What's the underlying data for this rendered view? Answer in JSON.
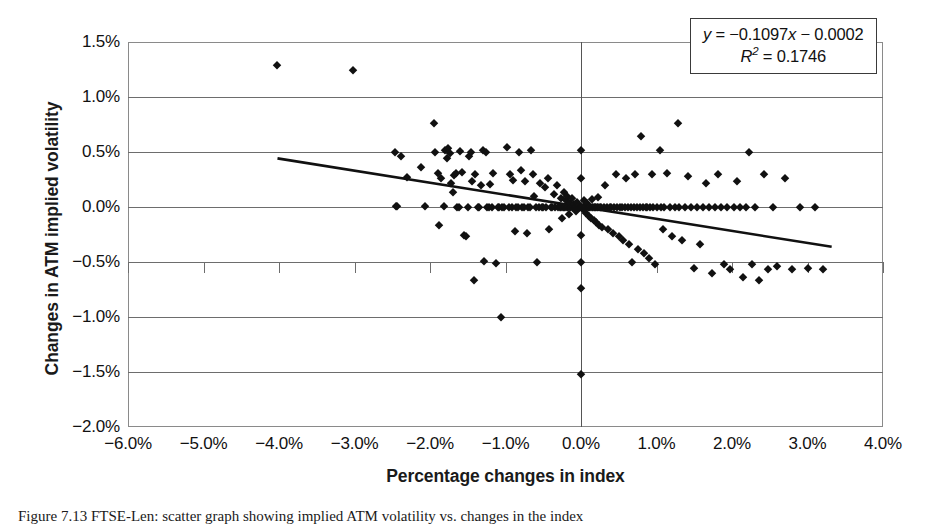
{
  "figure": {
    "caption": "Figure 7.13  FTSE-Len: scatter graph showing implied ATM volatility vs. changes in the index"
  },
  "annotation": {
    "equation": "y = −0.1097x − 0.0002",
    "equation_prefix": "y",
    "equation_body": " = −0.1097",
    "equation_var": "x",
    "equation_suffix": " − 0.0002",
    "r_squared_symbol": "R",
    "r_squared_exponent": "2",
    "r_squared_value": " = 0.1746",
    "slope": -0.1097,
    "intercept": -0.0002,
    "r_squared": 0.1746
  },
  "chart_data": {
    "type": "scatter",
    "title": "",
    "xlabel": "Percentage changes in index",
    "ylabel": "Changes in ATM implied volatility",
    "xlim": [
      -6.0,
      4.0
    ],
    "ylim": [
      -2.0,
      1.5
    ],
    "xticks": [
      -6.0,
      -5.0,
      -4.0,
      -3.0,
      -2.0,
      -1.0,
      0.0,
      1.0,
      2.0,
      3.0,
      4.0
    ],
    "yticks": [
      1.5,
      1.0,
      0.5,
      0.0,
      -0.5,
      -1.0,
      -1.5,
      -2.0
    ],
    "xtick_labels": [
      "-6.0%",
      "-5.0%",
      "-4.0%",
      "-3.0%",
      "-2.0%",
      "-1.0%",
      "0.0%",
      "1.0%",
      "2.0%",
      "3.0%",
      "4.0%"
    ],
    "ytick_labels": [
      "1.5%",
      "1.0%",
      "0.5%",
      "0.0%",
      "-0.5%",
      "-1.0%",
      "-1.5%",
      "-2.0%"
    ],
    "grid": "horizontal",
    "legend": "none",
    "marker": "diamond",
    "marker_color": "#111111",
    "trendline": {
      "type": "linear",
      "x_start": -4.02,
      "y_start": 0.442,
      "x_end": 3.32,
      "y_end": -0.362,
      "color": "#111111"
    },
    "points": [
      [
        -4.02,
        1.29
      ],
      [
        -3.02,
        1.25
      ],
      [
        -2.47,
        0.5
      ],
      [
        -2.38,
        0.46
      ],
      [
        -2.45,
        0.01
      ],
      [
        -2.44,
        0.005
      ],
      [
        -2.3,
        0.27
      ],
      [
        -2.12,
        0.36
      ],
      [
        -2.06,
        0.01
      ],
      [
        -1.95,
        0.76
      ],
      [
        -1.93,
        0.5
      ],
      [
        -1.9,
        0.31
      ],
      [
        -1.88,
        -0.16
      ],
      [
        -1.86,
        0.26
      ],
      [
        -1.82,
        0.01
      ],
      [
        -1.8,
        0.52
      ],
      [
        -1.78,
        0.45
      ],
      [
        -1.76,
        0.54
      ],
      [
        -1.74,
        0.49
      ],
      [
        -1.72,
        0.22
      ],
      [
        -1.7,
        0.14
      ],
      [
        -1.68,
        0.29
      ],
      [
        -1.66,
        0.31
      ],
      [
        -1.64,
        0.0
      ],
      [
        -1.62,
        0.0
      ],
      [
        -1.6,
        0.51
      ],
      [
        -1.57,
        0.32
      ],
      [
        -1.55,
        -0.25
      ],
      [
        -1.52,
        -0.26
      ],
      [
        -1.5,
        0.0
      ],
      [
        -1.48,
        0.46
      ],
      [
        -1.46,
        0.5
      ],
      [
        -1.44,
        0.24
      ],
      [
        -1.42,
        -0.66
      ],
      [
        -1.4,
        0.3
      ],
      [
        -1.37,
        0.0
      ],
      [
        -1.35,
        0.0
      ],
      [
        -1.32,
        0.2
      ],
      [
        -1.3,
        0.52
      ],
      [
        -1.28,
        -0.49
      ],
      [
        -1.26,
        0.5
      ],
      [
        -1.24,
        0.0
      ],
      [
        -1.22,
        0.0
      ],
      [
        -1.2,
        0.21
      ],
      [
        -1.18,
        0.0
      ],
      [
        -1.16,
        0.31
      ],
      [
        -1.13,
        -0.51
      ],
      [
        -1.1,
        0.0
      ],
      [
        -1.08,
        0.0
      ],
      [
        -1.06,
        -1.0
      ],
      [
        -1.04,
        0.0
      ],
      [
        -1.02,
        0.0
      ],
      [
        -0.98,
        0.55
      ],
      [
        -0.96,
        0.0
      ],
      [
        -0.94,
        0.3
      ],
      [
        -0.92,
        0.0
      ],
      [
        -0.9,
        0.25
      ],
      [
        -0.88,
        -0.22
      ],
      [
        -0.86,
        0.0
      ],
      [
        -0.84,
        0.0
      ],
      [
        -0.82,
        0.5
      ],
      [
        -0.8,
        0.34
      ],
      [
        -0.78,
        0.0
      ],
      [
        -0.76,
        0.0
      ],
      [
        -0.74,
        0.24
      ],
      [
        -0.72,
        -0.24
      ],
      [
        -0.7,
        0.0
      ],
      [
        -0.68,
        0.0
      ],
      [
        -0.66,
        0.52
      ],
      [
        -0.64,
        0.3
      ],
      [
        -0.62,
        0.1
      ],
      [
        -0.6,
        0.0
      ],
      [
        -0.58,
        -0.5
      ],
      [
        -0.56,
        0.0
      ],
      [
        -0.54,
        0.22
      ],
      [
        -0.52,
        0.0
      ],
      [
        -0.5,
        0.0
      ],
      [
        -0.48,
        0.18
      ],
      [
        -0.46,
        0.0
      ],
      [
        -0.44,
        0.26
      ],
      [
        -0.42,
        -0.2
      ],
      [
        -0.4,
        0.0
      ],
      [
        -0.38,
        0.0
      ],
      [
        -0.36,
        0.12
      ],
      [
        -0.34,
        0.0
      ],
      [
        -0.32,
        0.2
      ],
      [
        -0.3,
        0.0
      ],
      [
        -0.28,
        0.0
      ],
      [
        -0.27,
        0.08
      ],
      [
        -0.26,
        0.0
      ],
      [
        -0.25,
        -0.1
      ],
      [
        -0.24,
        0.0
      ],
      [
        -0.23,
        0.14
      ],
      [
        -0.22,
        0.0
      ],
      [
        -0.21,
        0.0
      ],
      [
        -0.2,
        0.06
      ],
      [
        -0.19,
        0.0
      ],
      [
        -0.18,
        0.1
      ],
      [
        -0.17,
        0.0
      ],
      [
        -0.16,
        -0.06
      ],
      [
        -0.15,
        0.0
      ],
      [
        -0.14,
        0.04
      ],
      [
        -0.13,
        0.0
      ],
      [
        -0.12,
        0.08
      ],
      [
        -0.11,
        0.0
      ],
      [
        -0.1,
        0.0
      ],
      [
        -0.09,
        0.03
      ],
      [
        -0.08,
        0.0
      ],
      [
        -0.07,
        -0.04
      ],
      [
        -0.06,
        0.0
      ],
      [
        -0.05,
        0.05
      ],
      [
        -0.04,
        0.0
      ],
      [
        -0.03,
        0.0
      ],
      [
        -0.02,
        0.02
      ],
      [
        -0.01,
        0.0
      ],
      [
        0.0,
        0.0
      ],
      [
        0.0,
        0.52
      ],
      [
        0.0,
        0.26
      ],
      [
        0.0,
        -0.25
      ],
      [
        0.0,
        -0.5
      ],
      [
        0.0,
        -0.74
      ],
      [
        0.0,
        -1.52
      ],
      [
        0.01,
        0.0
      ],
      [
        0.02,
        -0.02
      ],
      [
        0.03,
        0.0
      ],
      [
        0.04,
        0.06
      ],
      [
        0.05,
        0.0
      ],
      [
        0.06,
        -0.05
      ],
      [
        0.07,
        0.0
      ],
      [
        0.08,
        0.04
      ],
      [
        0.09,
        0.0
      ],
      [
        0.1,
        -0.08
      ],
      [
        0.11,
        0.0
      ],
      [
        0.12,
        0.0
      ],
      [
        0.13,
        -0.1
      ],
      [
        0.14,
        0.0
      ],
      [
        0.15,
        0.07
      ],
      [
        0.16,
        0.0
      ],
      [
        0.17,
        -0.12
      ],
      [
        0.18,
        0.0
      ],
      [
        0.19,
        0.0
      ],
      [
        0.2,
        -0.14
      ],
      [
        0.21,
        0.0
      ],
      [
        0.22,
        0.09
      ],
      [
        0.23,
        0.0
      ],
      [
        0.24,
        -0.16
      ],
      [
        0.25,
        0.0
      ],
      [
        0.26,
        0.0
      ],
      [
        0.28,
        -0.18
      ],
      [
        0.3,
        0.0
      ],
      [
        0.32,
        0.2
      ],
      [
        0.34,
        0.0
      ],
      [
        0.36,
        -0.2
      ],
      [
        0.38,
        0.0
      ],
      [
        0.4,
        0.0
      ],
      [
        0.42,
        -0.24
      ],
      [
        0.44,
        0.0
      ],
      [
        0.46,
        0.3
      ],
      [
        0.48,
        0.0
      ],
      [
        0.5,
        -0.26
      ],
      [
        0.52,
        0.0
      ],
      [
        0.54,
        0.0
      ],
      [
        0.56,
        -0.3
      ],
      [
        0.58,
        0.0
      ],
      [
        0.6,
        0.26
      ],
      [
        0.62,
        0.0
      ],
      [
        0.64,
        -0.34
      ],
      [
        0.66,
        0.0
      ],
      [
        0.68,
        -0.5
      ],
      [
        0.7,
        0.0
      ],
      [
        0.72,
        0.3
      ],
      [
        0.74,
        0.0
      ],
      [
        0.76,
        -0.38
      ],
      [
        0.78,
        0.0
      ],
      [
        0.8,
        0.65
      ],
      [
        0.82,
        0.0
      ],
      [
        0.84,
        -0.42
      ],
      [
        0.86,
        0.0
      ],
      [
        0.88,
        0.0
      ],
      [
        0.9,
        -0.46
      ],
      [
        0.92,
        0.0
      ],
      [
        0.94,
        0.3
      ],
      [
        0.96,
        0.0
      ],
      [
        0.98,
        -0.52
      ],
      [
        1.0,
        0.0
      ],
      [
        1.04,
        0.52
      ],
      [
        1.06,
        0.0
      ],
      [
        1.08,
        -0.2
      ],
      [
        1.1,
        0.0
      ],
      [
        1.14,
        0.31
      ],
      [
        1.18,
        0.0
      ],
      [
        1.2,
        -0.26
      ],
      [
        1.24,
        0.0
      ],
      [
        1.28,
        0.76
      ],
      [
        1.3,
        0.0
      ],
      [
        1.34,
        -0.3
      ],
      [
        1.38,
        0.0
      ],
      [
        1.42,
        0.28
      ],
      [
        1.46,
        0.0
      ],
      [
        1.5,
        -0.55
      ],
      [
        1.54,
        0.0
      ],
      [
        1.58,
        -0.34
      ],
      [
        1.62,
        0.0
      ],
      [
        1.66,
        0.22
      ],
      [
        1.7,
        0.0
      ],
      [
        1.74,
        -0.6
      ],
      [
        1.78,
        0.0
      ],
      [
        1.82,
        0.3
      ],
      [
        1.86,
        0.0
      ],
      [
        1.9,
        -0.52
      ],
      [
        1.94,
        0.0
      ],
      [
        1.98,
        -0.56
      ],
      [
        2.02,
        0.0
      ],
      [
        2.06,
        0.24
      ],
      [
        2.1,
        0.0
      ],
      [
        2.14,
        -0.64
      ],
      [
        2.18,
        0.0
      ],
      [
        2.22,
        0.5
      ],
      [
        2.26,
        -0.52
      ],
      [
        2.3,
        0.0
      ],
      [
        2.36,
        -0.66
      ],
      [
        2.42,
        0.3
      ],
      [
        2.48,
        -0.56
      ],
      [
        2.54,
        0.0
      ],
      [
        2.6,
        -0.54
      ],
      [
        2.7,
        0.26
      ],
      [
        2.8,
        -0.56
      ],
      [
        2.9,
        0.0
      ],
      [
        3.0,
        -0.55
      ],
      [
        3.1,
        0.0
      ],
      [
        3.2,
        -0.56
      ]
    ]
  }
}
